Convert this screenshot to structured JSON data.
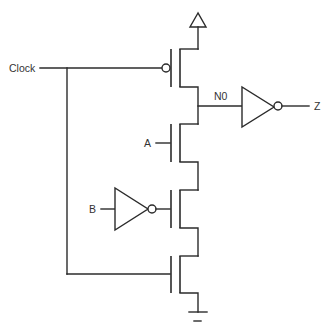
{
  "diagram": {
    "type": "transistor-level circuit schematic",
    "colors": {
      "line": "#2b2b2b",
      "text": "#333333",
      "background": "#ffffff"
    },
    "labels": {
      "clock": "Clock",
      "a": "A",
      "b": "B",
      "node": "N0",
      "output": "Z"
    },
    "components": [
      {
        "id": "vdd",
        "type": "supply",
        "symbol": "triangle"
      },
      {
        "id": "pmos-precharge",
        "type": "PMOS",
        "gate": "Clock"
      },
      {
        "id": "nmos-a",
        "type": "NMOS",
        "gate": "A"
      },
      {
        "id": "inverter-b",
        "type": "inverter",
        "input": "B"
      },
      {
        "id": "nmos-b",
        "type": "NMOS",
        "gate": "NOT B"
      },
      {
        "id": "nmos-clock",
        "type": "NMOS",
        "gate": "Clock"
      },
      {
        "id": "inverter-out",
        "type": "inverter",
        "input": "N0",
        "output": "Z"
      },
      {
        "id": "gnd",
        "type": "ground"
      }
    ]
  }
}
